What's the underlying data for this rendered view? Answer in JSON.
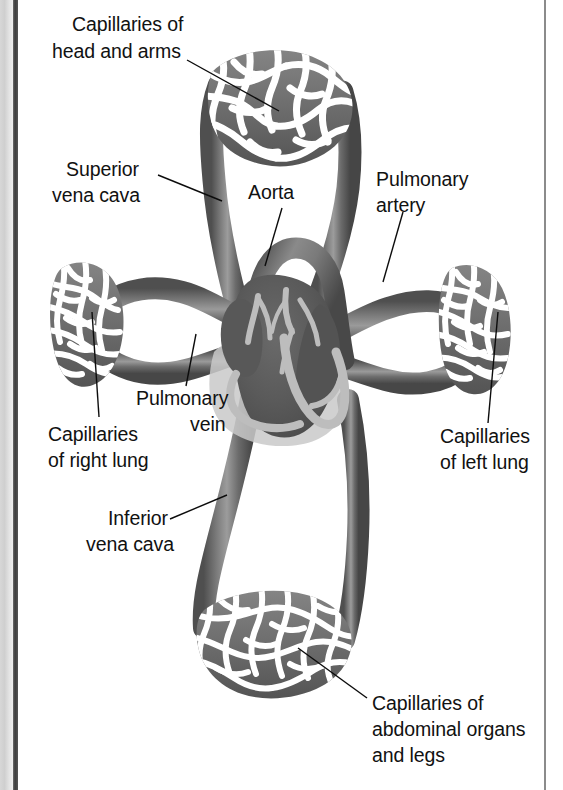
{
  "figure": {
    "type": "anatomical-diagram",
    "background_color": "#ffffff",
    "ink_color": "#111111",
    "vessel_color": "#6e6e6e",
    "vessel_dark_color": "#4a4a4a",
    "heart_color": "#5c5c5c",
    "heart_highlight_color": "#b9b9b9"
  },
  "labels": {
    "capillaries_head_arms": {
      "line1": "Capillaries of",
      "line2": "head and arms"
    },
    "superior_vena_cava": {
      "line1": "Superior",
      "line2": "vena cava"
    },
    "aorta": {
      "line1": "Aorta"
    },
    "pulmonary_artery": {
      "line1": "Pulmonary",
      "line2": "artery"
    },
    "pulmonary_vein": {
      "line1": "Pulmonary",
      "line2": "vein"
    },
    "capillaries_right_lung": {
      "line1": "Capillaries",
      "line2": "of right lung"
    },
    "capillaries_left_lung": {
      "line1": "Capillaries",
      "line2": "of left lung"
    },
    "inferior_vena_cava": {
      "line1": "Inferior",
      "line2": "vena cava"
    },
    "capillaries_abdominal": {
      "line1": "Capillaries of",
      "line2": "abdominal organs",
      "line3": "and legs"
    }
  },
  "structures": {
    "heart": "heart",
    "capillary_bed_top": "capillary-bed-head-and-arms",
    "capillary_bed_left": "capillary-bed-right-lung",
    "capillary_bed_right": "capillary-bed-left-lung",
    "capillary_bed_bottom": "capillary-bed-abdominal-organs-and-legs"
  }
}
